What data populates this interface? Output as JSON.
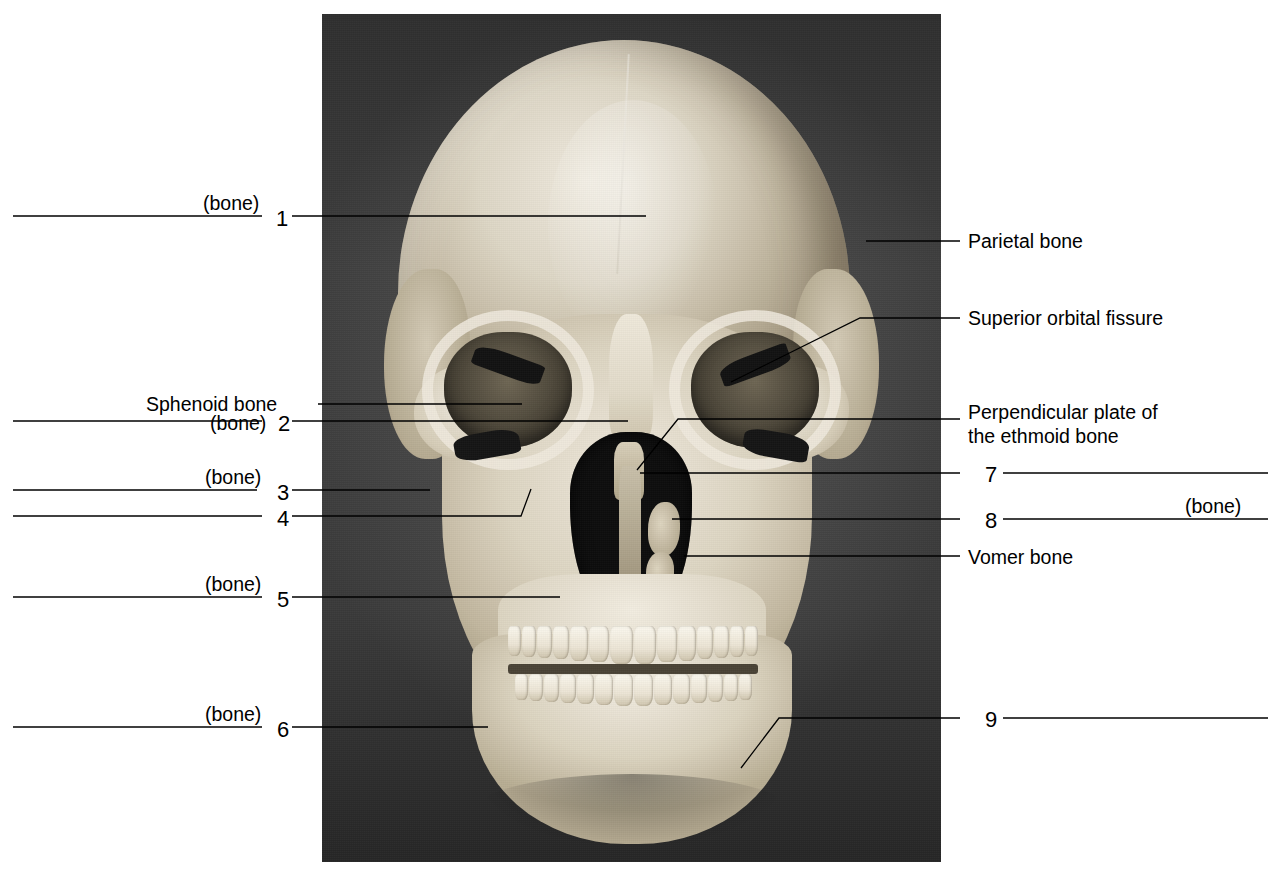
{
  "figure": {
    "bone_tag": "(bone)",
    "photo_alt": "Photograph of a human skull, anterior (frontal) view"
  },
  "left_items": [
    {
      "id": "item-1",
      "number": "1",
      "bone_tag": "(bone)",
      "label": "",
      "has_blank": true,
      "y": 216
    },
    {
      "id": "sphenoid",
      "number": "",
      "bone_tag": "",
      "label": "Sphenoid bone",
      "has_blank": false,
      "y": 404
    },
    {
      "id": "item-2",
      "number": "2",
      "bone_tag": "(bone)",
      "label": "",
      "has_blank": true,
      "y": 421
    },
    {
      "id": "item-3",
      "number": "3",
      "bone_tag": "(bone)",
      "label": "",
      "has_blank": true,
      "y": 490
    },
    {
      "id": "item-4",
      "number": "4",
      "bone_tag": "",
      "label": "",
      "has_blank": true,
      "y": 516
    },
    {
      "id": "item-5",
      "number": "5",
      "bone_tag": "(bone)",
      "label": "",
      "has_blank": true,
      "y": 597
    },
    {
      "id": "item-6",
      "number": "6",
      "bone_tag": "(bone)",
      "label": "",
      "has_blank": true,
      "y": 727
    }
  ],
  "right_items": [
    {
      "id": "parietal",
      "number": "",
      "bone_tag": "",
      "label": "Parietal bone",
      "has_blank": false,
      "y": 241
    },
    {
      "id": "sup-orbital-fissure",
      "number": "",
      "bone_tag": "",
      "label": "Superior orbital fissure",
      "has_blank": false,
      "y": 317
    },
    {
      "id": "perp-plate-ethmoid",
      "number": "",
      "bone_tag": "",
      "label": "Perpendicular plate of\nthe ethmoid bone",
      "has_blank": false,
      "y": 411
    },
    {
      "id": "item-7",
      "number": "7",
      "bone_tag": "",
      "label": "",
      "has_blank": true,
      "y": 473
    },
    {
      "id": "item-8",
      "number": "8",
      "bone_tag": "(bone)",
      "label": "",
      "has_blank": true,
      "y": 519
    },
    {
      "id": "vomer",
      "number": "",
      "bone_tag": "",
      "label": "Vomer bone",
      "has_blank": false,
      "y": 556
    },
    {
      "id": "item-9",
      "number": "9",
      "bone_tag": "",
      "label": "",
      "has_blank": true,
      "y": 718
    }
  ],
  "labels": {
    "sphenoid_bone": "Sphenoid bone",
    "parietal_bone": "Parietal bone",
    "superior_orbital_fissure": "Superior orbital fissure",
    "perpendicular_plate_line1": "Perpendicular plate of",
    "perpendicular_plate_line2": "the ethmoid bone",
    "vomer_bone": "Vomer bone",
    "bone": "(bone)"
  },
  "numbers": {
    "n1": "1",
    "n2": "2",
    "n3": "3",
    "n4": "4",
    "n5": "5",
    "n6": "6",
    "n7": "7",
    "n8": "8",
    "n9": "9"
  },
  "colors": {
    "ink": "#000000",
    "page": "#ffffff",
    "photo_background": "#3a3a3a",
    "bone_light": "#efe9db",
    "bone_mid": "#cdc3ac",
    "bone_shadow": "#a89d85",
    "cavity": "#0d0d0d"
  }
}
